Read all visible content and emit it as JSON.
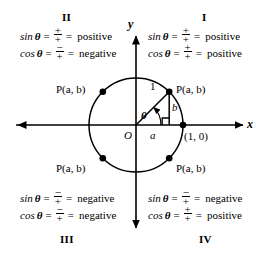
{
  "figure": {
    "axes": {
      "x_label": "x",
      "y_label": "y",
      "origin_label": "O"
    },
    "circle": {
      "radius_label": "1",
      "angle_label": "θ",
      "leg_horizontal_label": "a",
      "leg_vertical_label": "b",
      "intersection_point_label": "(1, 0)",
      "point_label": "P(a, b)",
      "right_angle_marker": "right-angle-square"
    },
    "points": [
      {
        "quadrant": "I",
        "label": "P(a, b)"
      },
      {
        "quadrant": "II",
        "label": "P(a, b)"
      },
      {
        "quadrant": "III",
        "label": "P(a, b)"
      },
      {
        "quadrant": "IV",
        "label": "P(a, b)"
      }
    ],
    "quadrants": [
      {
        "id": "I",
        "numeral": "I",
        "rows": [
          {
            "fn": "sin",
            "theta": "θ",
            "numerator": "+",
            "denominator": "+",
            "sign": "positive"
          },
          {
            "fn": "cos",
            "theta": "θ",
            "numerator": "+",
            "denominator": "+",
            "sign": "positive"
          }
        ]
      },
      {
        "id": "II",
        "numeral": "II",
        "rows": [
          {
            "fn": "sin",
            "theta": "θ",
            "numerator": "+",
            "denominator": "+",
            "sign": "positive"
          },
          {
            "fn": "cos",
            "theta": "θ",
            "numerator": "−",
            "denominator": "+",
            "sign": "negative"
          }
        ]
      },
      {
        "id": "III",
        "numeral": "III",
        "rows": [
          {
            "fn": "sin",
            "theta": "θ",
            "numerator": "−",
            "denominator": "+",
            "sign": "negative"
          },
          {
            "fn": "cos",
            "theta": "θ",
            "numerator": "−",
            "denominator": "+",
            "sign": "negative"
          }
        ]
      },
      {
        "id": "IV",
        "numeral": "IV",
        "rows": [
          {
            "fn": "sin",
            "theta": "θ",
            "numerator": "−",
            "denominator": "+",
            "sign": "negative"
          },
          {
            "fn": "cos",
            "theta": "θ",
            "numerator": "+",
            "denominator": "+",
            "sign": "positive"
          }
        ]
      }
    ],
    "symbols": {
      "equals": "=",
      "equals2": "="
    },
    "colors": {
      "ink": "#000000",
      "background": "#ffffff"
    }
  }
}
